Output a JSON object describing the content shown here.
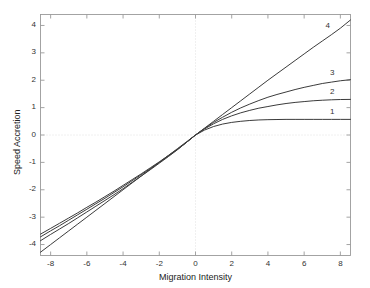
{
  "figure": {
    "top_title_remnant": "",
    "background_color": "#ffffff",
    "axes_color": "#9a9a9a",
    "grid_color": "#d8d8d8",
    "curve_color": "#3b3b3b"
  },
  "chart_data": {
    "type": "line",
    "title": "",
    "xlabel": "Migration Intensity",
    "ylabel": "Speed Accretion",
    "xlim": [
      -8.56,
      8.56
    ],
    "ylim": [
      -4.4,
      4.4
    ],
    "xticks": [
      -8,
      -6,
      -4,
      -2,
      0,
      2,
      4,
      6,
      8
    ],
    "xticklabels": [
      "-8",
      "-6",
      "-4",
      "-2",
      "0",
      "2",
      "4",
      "6",
      "8"
    ],
    "yticks": [
      -4,
      -3,
      -2,
      -1,
      0,
      1,
      2,
      3,
      4
    ],
    "yticklabels": [
      "-4",
      "-3",
      "-2",
      "-1",
      "0",
      "1",
      "2",
      "3",
      "4"
    ],
    "grid": "dotted reference lines at x=0 and y=0",
    "legend_position": "inline end-of-curve labels at right",
    "x": [
      -8.56,
      -8.0,
      -7.5,
      -7.0,
      -6.5,
      -6.0,
      -5.5,
      -5.0,
      -4.5,
      -4.0,
      -3.5,
      -3.0,
      -2.5,
      -2.0,
      -1.5,
      -1.0,
      -0.5,
      0.0,
      0.5,
      1.0,
      1.5,
      2.0,
      2.5,
      3.0,
      3.5,
      4.0,
      4.5,
      5.0,
      5.5,
      6.0,
      6.5,
      7.0,
      7.5,
      8.0,
      8.56
    ],
    "series": [
      {
        "name": "1",
        "label": "1",
        "label_x": 7.6,
        "label_y": 0.82,
        "saturation_positive": 0.57,
        "values": [
          -3.62,
          -3.41,
          -3.22,
          -3.03,
          -2.84,
          -2.64,
          -2.45,
          -2.25,
          -2.05,
          -1.84,
          -1.63,
          -1.42,
          -1.2,
          -0.98,
          -0.75,
          -0.52,
          -0.27,
          0.0,
          0.18,
          0.31,
          0.4,
          0.46,
          0.5,
          0.53,
          0.55,
          0.56,
          0.565,
          0.57,
          0.57,
          0.57,
          0.57,
          0.57,
          0.57,
          0.57,
          0.57
        ]
      },
      {
        "name": "2",
        "label": "2",
        "label_x": 7.6,
        "label_y": 1.55,
        "saturation_positive": 1.3,
        "values": [
          -3.72,
          -3.5,
          -3.31,
          -3.11,
          -2.91,
          -2.71,
          -2.51,
          -2.31,
          -2.1,
          -1.89,
          -1.67,
          -1.45,
          -1.23,
          -1.0,
          -0.77,
          -0.53,
          -0.27,
          0.0,
          0.22,
          0.41,
          0.57,
          0.7,
          0.81,
          0.9,
          0.98,
          1.04,
          1.1,
          1.15,
          1.19,
          1.22,
          1.25,
          1.27,
          1.285,
          1.295,
          1.3
        ]
      },
      {
        "name": "3",
        "label": "3",
        "label_x": 7.6,
        "label_y": 2.25,
        "saturation_positive": 2.02,
        "values": [
          -3.86,
          -3.63,
          -3.43,
          -3.23,
          -3.02,
          -2.81,
          -2.6,
          -2.39,
          -2.18,
          -1.96,
          -1.73,
          -1.5,
          -1.27,
          -1.03,
          -0.79,
          -0.54,
          -0.27,
          0.0,
          0.24,
          0.46,
          0.65,
          0.83,
          0.99,
          1.13,
          1.26,
          1.38,
          1.48,
          1.57,
          1.66,
          1.74,
          1.81,
          1.88,
          1.93,
          1.98,
          2.02
        ]
      },
      {
        "name": "4",
        "label": "4",
        "label_x": 7.35,
        "label_y": 3.95,
        "saturation_positive": 4.2,
        "values": [
          -4.28,
          -4.0,
          -3.75,
          -3.5,
          -3.25,
          -3.0,
          -2.75,
          -2.5,
          -2.25,
          -2.0,
          -1.75,
          -1.5,
          -1.25,
          -1.0,
          -0.75,
          -0.5,
          -0.25,
          0.0,
          0.25,
          0.5,
          0.75,
          1.0,
          1.25,
          1.5,
          1.75,
          2.0,
          2.24,
          2.48,
          2.72,
          2.96,
          3.2,
          3.43,
          3.66,
          3.9,
          4.2
        ]
      }
    ]
  }
}
